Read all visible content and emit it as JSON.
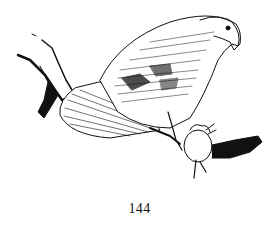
{
  "page": {
    "number": "144",
    "illustration": {
      "subject": "hawk-with-prey-icon",
      "ink_color": "#111111",
      "paper_color": "#ffffff"
    }
  }
}
